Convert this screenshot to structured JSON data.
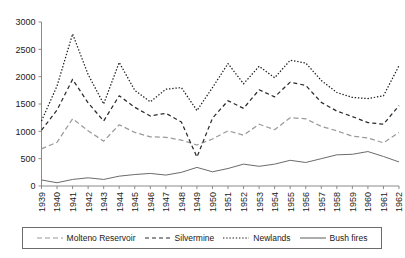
{
  "chart_data": {
    "type": "line",
    "title": "",
    "xlabel": "",
    "ylabel": "",
    "ylim": [
      0,
      3000
    ],
    "ytick_step": 500,
    "yticks": [
      "0",
      "500",
      "1000",
      "1500",
      "2000",
      "2500",
      "3000"
    ],
    "grid": false,
    "legend_position": "bottom",
    "x": [
      1939,
      1940,
      1941,
      1942,
      1943,
      1944,
      1945,
      1946,
      1947,
      1948,
      1949,
      1950,
      1951,
      1952,
      1953,
      1954,
      1955,
      1956,
      1957,
      1958,
      1959,
      1960,
      1961,
      1962
    ],
    "xticks": [
      "1939",
      "1940",
      "1941",
      "1942",
      "1943",
      "1944",
      "1945",
      "1946",
      "1947",
      "1948",
      "1949",
      "1950",
      "1951",
      "1952",
      "1953",
      "1954",
      "1955",
      "1956",
      "1957",
      "1958",
      "1959",
      "1960",
      "1961",
      "1962"
    ],
    "series": [
      {
        "name": "Molteno Reservoir",
        "style": "dashed",
        "color": "#9a9a9a",
        "values": [
          680,
          800,
          1230,
          1010,
          820,
          1120,
          980,
          900,
          890,
          840,
          750,
          860,
          1010,
          930,
          1130,
          1030,
          1250,
          1230,
          1090,
          1010,
          910,
          880,
          790,
          980
        ]
      },
      {
        "name": "Silvermine",
        "style": "dashed",
        "color": "#2b2b2b",
        "values": [
          1020,
          1390,
          1950,
          1520,
          1190,
          1650,
          1440,
          1280,
          1330,
          1170,
          530,
          1240,
          1560,
          1420,
          1760,
          1630,
          1900,
          1840,
          1530,
          1370,
          1270,
          1160,
          1130,
          1470
        ]
      },
      {
        "name": "Newlands",
        "style": "dotted",
        "color": "#1a1a1a",
        "values": [
          1190,
          1830,
          2780,
          2040,
          1500,
          2260,
          1750,
          1540,
          1770,
          1800,
          1380,
          1800,
          2240,
          1870,
          2190,
          1980,
          2300,
          2250,
          1930,
          1710,
          1620,
          1600,
          1650,
          2200
        ]
      },
      {
        "name": "Bush fires",
        "style": "solid",
        "color": "#6b6b6b",
        "values": [
          110,
          60,
          120,
          150,
          120,
          180,
          210,
          230,
          200,
          250,
          340,
          260,
          320,
          400,
          360,
          400,
          470,
          430,
          500,
          570,
          580,
          630,
          540,
          440
        ]
      }
    ]
  },
  "legend": {
    "items": [
      {
        "label": "Molteno Reservoir",
        "icon": "dashed-line-icon"
      },
      {
        "label": "Silvermine",
        "icon": "dashed-line-icon"
      },
      {
        "label": "Newlands",
        "icon": "dotted-line-icon"
      },
      {
        "label": "Bush fires",
        "icon": "solid-line-icon"
      }
    ]
  }
}
